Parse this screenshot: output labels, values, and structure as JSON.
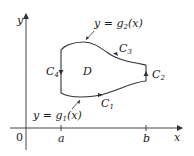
{
  "diagram": {
    "axes": {
      "x_label": "x",
      "y_label": "y",
      "origin_label": "0",
      "ticks": [
        {
          "label": "a"
        },
        {
          "label": "b"
        }
      ]
    },
    "region": {
      "label": "D"
    },
    "curves": {
      "upper": {
        "text": "y = g",
        "sub": "2",
        "arg": "(x)"
      },
      "lower": {
        "text": "y = g",
        "sub": "1",
        "arg": "(x)"
      }
    },
    "boundary_labels": [
      {
        "name": "C",
        "sub": "1"
      },
      {
        "name": "C",
        "sub": "2"
      },
      {
        "name": "C",
        "sub": "3"
      },
      {
        "name": "C",
        "sub": "4"
      }
    ],
    "colors": {
      "stroke": "#333333",
      "text": "#1a1a1a",
      "background": "#ffffff"
    }
  }
}
